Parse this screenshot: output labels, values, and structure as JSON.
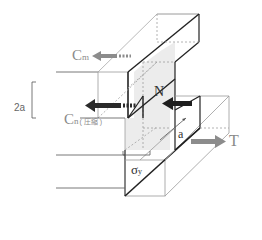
{
  "diagram": {
    "type": "structural-mechanics",
    "colors": {
      "line_dark": "#222222",
      "line_light": "#9a9a9a",
      "dashed": "#a0a0a0",
      "shaded_face": "#ececec",
      "arrow_gray": "#8c8c8c",
      "arrow_dark": "#1e1e1e",
      "label_gray": "#8a8a8a"
    },
    "labels": {
      "cm": "C",
      "cm_sub": "m",
      "cn": "C",
      "cn_sub": "n",
      "cn_note": "( 圧縮 )",
      "n": "N",
      "a": "a",
      "t": "T",
      "sigma": "σ",
      "sigma_sub": "y",
      "two_a": "2a"
    },
    "forces": [
      {
        "name": "Cm",
        "direction": "left",
        "style": "gray-arrow"
      },
      {
        "name": "Cn (compression)",
        "direction": "left",
        "style": "dark-arrow"
      },
      {
        "name": "N",
        "direction": "left",
        "style": "dark-arrow"
      },
      {
        "name": "T",
        "direction": "right",
        "style": "gray-arrow"
      }
    ],
    "dimensions": [
      {
        "label": "2a",
        "type": "vertical-bracket"
      },
      {
        "label": "a",
        "type": "diagonal-arrow"
      },
      {
        "label": "σy",
        "type": "width-bracket"
      }
    ]
  }
}
